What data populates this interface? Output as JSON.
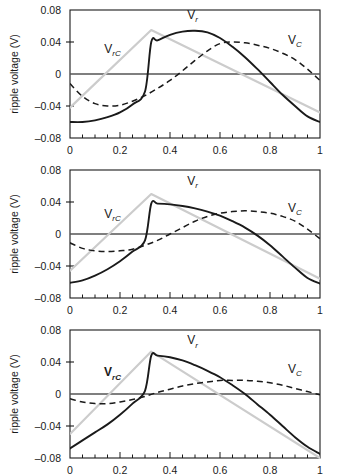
{
  "figure": {
    "panel_count": 3,
    "background": "#ffffff",
    "axis_color": "#1a1a1a",
    "colors": {
      "vr_solid": "#1a1a1a",
      "vc_dashed": "#1a1a1a",
      "vrc_gray": "#cccccc",
      "zero_line": "#555555"
    }
  },
  "axes": {
    "ylabel": "ripple voltage (V)",
    "yticklabels": [
      "0.08",
      "0.04",
      "0",
      "-0.04",
      "-0.08"
    ],
    "yticks": [
      0.08,
      0.04,
      0,
      -0.04,
      -0.08
    ],
    "ylim": [
      -0.08,
      0.08
    ],
    "xticklabels": [
      "0",
      "0.2",
      "0.4",
      "0.6",
      "0.8",
      "1"
    ],
    "xticks": [
      0,
      0.2,
      0.4,
      0.6,
      0.8,
      1
    ],
    "xminor_step": 0.05,
    "xlim": [
      0,
      1
    ],
    "xlabel": ""
  },
  "labels": {
    "vr": {
      "base": "V",
      "sub": "r"
    },
    "vc": {
      "base": "V",
      "sub": "C"
    },
    "vrc": {
      "base": "V",
      "sub": "rC"
    }
  },
  "chart_data": [
    {
      "type": "line",
      "title": "",
      "xlabel": "",
      "ylabel": "ripple voltage (V)",
      "xlim": [
        0,
        1
      ],
      "ylim": [
        -0.08,
        0.08
      ],
      "grid": false,
      "legend_position": "inline-annotations",
      "annotations": [
        {
          "text": "V_rC",
          "x": 0.17,
          "y": 0.026,
          "bold": false
        },
        {
          "text": "V_r",
          "x": 0.49,
          "y": 0.069,
          "bold": false
        },
        {
          "text": "V_C",
          "x": 0.9,
          "y": 0.038,
          "bold": false
        }
      ],
      "series": [
        {
          "name": "V_r",
          "style": "solid",
          "color": "#1a1a1a",
          "x": [
            0.0,
            0.05,
            0.1,
            0.15,
            0.2,
            0.25,
            0.3,
            0.325,
            0.35,
            0.4,
            0.45,
            0.5,
            0.55,
            0.6,
            0.65,
            0.7,
            0.75,
            0.8,
            0.85,
            0.9,
            0.95,
            1.0
          ],
          "y": [
            -0.06,
            -0.06,
            -0.058,
            -0.054,
            -0.048,
            -0.038,
            -0.022,
            0.04,
            0.042,
            0.049,
            0.053,
            0.054,
            0.052,
            0.045,
            0.034,
            0.021,
            0.006,
            -0.01,
            -0.026,
            -0.04,
            -0.053,
            -0.06
          ]
        },
        {
          "name": "V_C",
          "style": "dashed",
          "color": "#1a1a1a",
          "x": [
            0.0,
            0.05,
            0.1,
            0.15,
            0.2,
            0.25,
            0.3,
            0.35,
            0.4,
            0.45,
            0.5,
            0.55,
            0.6,
            0.65,
            0.7,
            0.75,
            0.8,
            0.85,
            0.9,
            0.95,
            1.0
          ],
          "y": [
            -0.012,
            -0.028,
            -0.037,
            -0.04,
            -0.039,
            -0.034,
            -0.027,
            -0.018,
            -0.008,
            0.004,
            0.017,
            0.029,
            0.038,
            0.04,
            0.039,
            0.036,
            0.032,
            0.026,
            0.018,
            0.006,
            -0.008
          ]
        },
        {
          "name": "V_rC",
          "style": "solid-gray",
          "color": "#cccccc",
          "x": [
            0.0,
            0.325,
            1.0
          ],
          "y": [
            -0.042,
            0.055,
            -0.048
          ]
        }
      ]
    },
    {
      "type": "line",
      "title": "",
      "xlabel": "",
      "ylabel": "ripple voltage (V)",
      "xlim": [
        0,
        1
      ],
      "ylim": [
        -0.08,
        0.08
      ],
      "grid": false,
      "legend_position": "inline-annotations",
      "annotations": [
        {
          "text": "V_rC",
          "x": 0.17,
          "y": 0.02,
          "bold": false
        },
        {
          "text": "V_r",
          "x": 0.49,
          "y": 0.061,
          "bold": false
        },
        {
          "text": "V_C",
          "x": 0.9,
          "y": 0.028,
          "bold": false
        }
      ],
      "series": [
        {
          "name": "V_r",
          "style": "solid",
          "color": "#1a1a1a",
          "x": [
            0.0,
            0.05,
            0.1,
            0.15,
            0.2,
            0.25,
            0.3,
            0.325,
            0.35,
            0.4,
            0.45,
            0.5,
            0.55,
            0.6,
            0.65,
            0.7,
            0.75,
            0.8,
            0.85,
            0.9,
            0.95,
            1.0
          ],
          "y": [
            -0.061,
            -0.058,
            -0.052,
            -0.044,
            -0.034,
            -0.022,
            -0.008,
            0.038,
            0.038,
            0.037,
            0.035,
            0.032,
            0.028,
            0.023,
            0.016,
            0.008,
            -0.002,
            -0.014,
            -0.028,
            -0.042,
            -0.055,
            -0.062
          ]
        },
        {
          "name": "V_C",
          "style": "dashed",
          "color": "#1a1a1a",
          "x": [
            0.0,
            0.05,
            0.1,
            0.15,
            0.2,
            0.25,
            0.3,
            0.35,
            0.4,
            0.45,
            0.5,
            0.55,
            0.6,
            0.65,
            0.7,
            0.75,
            0.8,
            0.85,
            0.9,
            0.95,
            1.0
          ],
          "y": [
            -0.011,
            -0.018,
            -0.021,
            -0.022,
            -0.021,
            -0.019,
            -0.014,
            -0.008,
            0.0,
            0.008,
            0.016,
            0.022,
            0.026,
            0.028,
            0.029,
            0.028,
            0.026,
            0.022,
            0.016,
            0.006,
            -0.006
          ]
        },
        {
          "name": "V_rC",
          "style": "solid-gray",
          "color": "#cccccc",
          "x": [
            0.0,
            0.325,
            1.0
          ],
          "y": [
            -0.046,
            0.05,
            -0.056
          ]
        }
      ]
    },
    {
      "type": "line",
      "title": "",
      "xlabel": "",
      "ylabel": "ripple voltage (V)",
      "xlim": [
        0,
        1
      ],
      "ylim": [
        -0.08,
        0.08
      ],
      "grid": false,
      "legend_position": "inline-annotations",
      "clipped_at_bottom": true,
      "annotations": [
        {
          "text": "V_rC",
          "x": 0.17,
          "y": 0.022,
          "bold": true
        },
        {
          "text": "V_r",
          "x": 0.49,
          "y": 0.062,
          "bold": false
        },
        {
          "text": "V_C",
          "x": 0.9,
          "y": 0.026,
          "bold": false
        }
      ],
      "series": [
        {
          "name": "V_r",
          "style": "solid",
          "color": "#1a1a1a",
          "x": [
            0.0,
            0.05,
            0.1,
            0.15,
            0.2,
            0.25,
            0.3,
            0.325,
            0.35,
            0.4,
            0.45,
            0.5,
            0.55,
            0.6,
            0.65,
            0.7,
            0.75,
            0.8,
            0.85,
            0.9,
            0.95,
            1.0
          ],
          "y": [
            -0.068,
            -0.058,
            -0.048,
            -0.038,
            -0.026,
            -0.012,
            0.004,
            0.048,
            0.048,
            0.046,
            0.042,
            0.036,
            0.029,
            0.021,
            0.011,
            0.0,
            -0.013,
            -0.026,
            -0.04,
            -0.054,
            -0.066,
            -0.075
          ]
        },
        {
          "name": "V_C",
          "style": "dashed",
          "color": "#1a1a1a",
          "x": [
            0.0,
            0.05,
            0.1,
            0.15,
            0.2,
            0.25,
            0.3,
            0.35,
            0.4,
            0.45,
            0.5,
            0.55,
            0.6,
            0.65,
            0.7,
            0.75,
            0.8,
            0.85,
            0.9,
            0.95,
            1.0
          ],
          "y": [
            -0.006,
            -0.01,
            -0.012,
            -0.012,
            -0.01,
            -0.007,
            -0.003,
            0.002,
            0.006,
            0.01,
            0.013,
            0.015,
            0.017,
            0.017,
            0.017,
            0.016,
            0.014,
            0.011,
            0.007,
            0.003,
            -0.001
          ]
        },
        {
          "name": "V_rC",
          "style": "solid-gray",
          "color": "#cccccc",
          "x": [
            0.0,
            0.325,
            1.0
          ],
          "y": [
            -0.05,
            0.053,
            -0.08
          ]
        }
      ]
    }
  ]
}
